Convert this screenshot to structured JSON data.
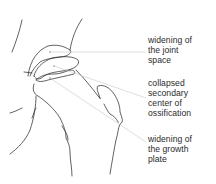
{
  "diagram": {
    "labels": [
      {
        "id": "joint-space",
        "text": "widening of\nthe joint\nspace"
      },
      {
        "id": "ossification",
        "text": "collapsed\nsecondary\ncenter of\nossification"
      },
      {
        "id": "growth-plate",
        "text": "widening of\nthe growth\nplate"
      }
    ],
    "colors": {
      "line": "#3a3a3a",
      "leader": "#c8c8c8",
      "text": "#2a2a2a",
      "background": "#ffffff"
    }
  }
}
